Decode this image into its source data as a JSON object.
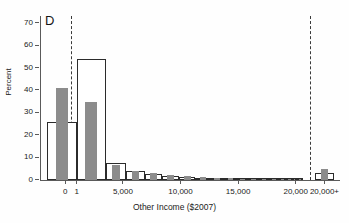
{
  "figure": {
    "panel_label": "D",
    "background": "#fefefe"
  },
  "chart_data": {
    "type": "bar",
    "title": "",
    "subtitle": "",
    "panel": "D",
    "xlabel": "Other Income ($2007)",
    "ylabel": "Percent",
    "ylim": [
      0,
      73
    ],
    "xlim": [
      -2200,
      23500
    ],
    "grid": false,
    "legend_position": "none",
    "y_ticks": [
      0,
      10,
      20,
      30,
      40,
      50,
      60,
      70
    ],
    "y_tick_labels": [
      "0",
      "10",
      "20",
      "30",
      "40",
      "50",
      "60",
      "70"
    ],
    "x_ticks": [
      0,
      1000,
      5000,
      10000,
      15000,
      20000,
      22500
    ],
    "x_tick_labels": [
      "0",
      "1",
      "5,000",
      "10,000",
      "15,000",
      "20,000",
      "20,000+"
    ],
    "separator_lines": [
      500,
      21200
    ],
    "series": [
      {
        "name": "outline",
        "style": "open",
        "color": "#ffffff",
        "edge_color": "#2b2b2b",
        "values": [
          25.8,
          54.2,
          7.8,
          3.9,
          2.9,
          2.0,
          1.5,
          1.1,
          0.8,
          0.6,
          0.45,
          0.35,
          0.3,
          0.22,
          0.18,
          0.15,
          0.12,
          0.1,
          3.1
        ]
      },
      {
        "name": "filled",
        "style": "filled",
        "color": "#8c8c8c",
        "edge_color": "#8c8c8c",
        "values": [
          41.0,
          35.0,
          6.5,
          4.0,
          3.2,
          2.3,
          1.7,
          1.3,
          0.9,
          0.7,
          0.5,
          0.4,
          0.3,
          0.25,
          0.2,
          0.16,
          0.13,
          0.1,
          5.0
        ]
      }
    ],
    "bin_labels": [
      "0",
      "1-2,500",
      "2,500-5,000",
      "5,000-6,500",
      "6,500-8,000",
      "8,000-9,500",
      "9,500-11,000",
      "11,000-12,500",
      "12,500-14,000",
      "14,000-15,000",
      "15,000-16,000",
      "16,000-17,000",
      "17,000-18,000",
      "18,000-18,800",
      "18,800-19,400",
      "19,400-19,800",
      "19,800-20,000",
      "20,000",
      "20,000+"
    ]
  }
}
